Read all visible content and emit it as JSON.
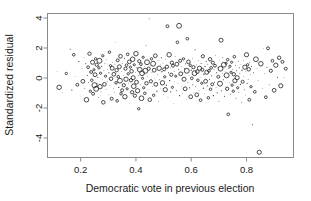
{
  "chart_data": {
    "type": "scatter",
    "title": "",
    "xlabel": "Democratic vote in previous election",
    "ylabel": "Standardized residual",
    "xlim": [
      0.08,
      0.97
    ],
    "ylim": [
      -5.3,
      4.3
    ],
    "xticks": [
      0.2,
      0.4,
      0.6,
      0.8
    ],
    "xticklabels": [
      "0.2",
      "0.4",
      "0.6",
      "0.8"
    ],
    "yticks": [
      -4,
      -2,
      0,
      2,
      4
    ],
    "yticklabels": [
      "-4",
      "-2",
      "0",
      "2",
      "4"
    ],
    "grid": false,
    "legend": null,
    "marker": "open-circle",
    "marker_color": "#2b2b2b",
    "points": [
      [
        0.115,
        0.45
      ],
      [
        0.122,
        -0.62
      ],
      [
        0.133,
        -0.95
      ],
      [
        0.148,
        0.3
      ],
      [
        0.162,
        1.92
      ],
      [
        0.168,
        -0.8
      ],
      [
        0.175,
        1.55
      ],
      [
        0.181,
        0.1
      ],
      [
        0.188,
        -0.45
      ],
      [
        0.193,
        1.1
      ],
      [
        0.198,
        -1.2
      ],
      [
        0.205,
        0.62
      ],
      [
        0.208,
        -0.22
      ],
      [
        0.212,
        1.38
      ],
      [
        0.215,
        -0.7
      ],
      [
        0.218,
        0.95
      ],
      [
        0.221,
        -1.45
      ],
      [
        0.224,
        0.18
      ],
      [
        0.227,
        0.72
      ],
      [
        0.229,
        -0.3
      ],
      [
        0.232,
        1.62
      ],
      [
        0.235,
        -0.88
      ],
      [
        0.238,
        0.4
      ],
      [
        0.24,
        -0.15
      ],
      [
        0.243,
        1.05
      ],
      [
        0.245,
        -1.05
      ],
      [
        0.248,
        0.55
      ],
      [
        0.25,
        -0.48
      ],
      [
        0.252,
        0.22
      ],
      [
        0.254,
        1.28
      ],
      [
        0.256,
        -0.72
      ],
      [
        0.258,
        0.88
      ],
      [
        0.26,
        -0.35
      ],
      [
        0.262,
        0.05
      ],
      [
        0.264,
        -1.3
      ],
      [
        0.266,
        0.68
      ],
      [
        0.268,
        1.15
      ],
      [
        0.27,
        -0.58
      ],
      [
        0.272,
        0.32
      ],
      [
        0.274,
        -0.92
      ],
      [
        0.276,
        0.78
      ],
      [
        0.278,
        -0.1
      ],
      [
        0.28,
        1.48
      ],
      [
        0.282,
        -1.62
      ],
      [
        0.284,
        0.48
      ],
      [
        0.286,
        -0.42
      ],
      [
        0.288,
        0.95
      ],
      [
        0.29,
        0.12
      ],
      [
        0.292,
        -0.78
      ],
      [
        0.294,
        1.22
      ],
      [
        0.296,
        -0.25
      ],
      [
        0.298,
        0.58
      ],
      [
        0.3,
        -1.12
      ],
      [
        0.302,
        0.35
      ],
      [
        0.304,
        1.72
      ],
      [
        0.306,
        -0.52
      ],
      [
        0.308,
        0.82
      ],
      [
        0.31,
        -0.05
      ],
      [
        0.312,
        -1.38
      ],
      [
        0.314,
        0.65
      ],
      [
        0.316,
        1.02
      ],
      [
        0.318,
        -0.68
      ],
      [
        0.32,
        0.25
      ],
      [
        0.322,
        -0.98
      ],
      [
        0.324,
        0.92
      ],
      [
        0.326,
        2.35
      ],
      [
        0.328,
        -0.32
      ],
      [
        0.33,
        0.52
      ],
      [
        0.332,
        -1.52
      ],
      [
        0.334,
        1.18
      ],
      [
        0.336,
        0.08
      ],
      [
        0.338,
        -0.62
      ],
      [
        0.34,
        0.75
      ],
      [
        0.342,
        -0.18
      ],
      [
        0.344,
        1.45
      ],
      [
        0.346,
        -1.05
      ],
      [
        0.348,
        0.42
      ],
      [
        0.35,
        -0.82
      ],
      [
        0.352,
        0.98
      ],
      [
        0.354,
        0.18
      ],
      [
        0.356,
        -0.48
      ],
      [
        0.358,
        1.32
      ],
      [
        0.36,
        -1.25
      ],
      [
        0.362,
        0.62
      ],
      [
        0.364,
        -0.08
      ],
      [
        0.366,
        0.85
      ],
      [
        0.368,
        -0.72
      ],
      [
        0.37,
        1.58
      ],
      [
        0.372,
        0.28
      ],
      [
        0.374,
        -0.38
      ],
      [
        0.376,
        1.08
      ],
      [
        0.378,
        -1.72
      ],
      [
        0.38,
        0.72
      ],
      [
        0.382,
        -0.15
      ],
      [
        0.384,
        0.45
      ],
      [
        0.386,
        -0.95
      ],
      [
        0.388,
        1.25
      ],
      [
        0.39,
        0.02
      ],
      [
        0.392,
        -0.55
      ],
      [
        0.394,
        0.88
      ],
      [
        0.396,
        -1.18
      ],
      [
        0.398,
        0.38
      ],
      [
        0.4,
        1.62
      ],
      [
        0.402,
        -0.28
      ],
      [
        0.404,
        0.68
      ],
      [
        0.406,
        -0.85
      ],
      [
        0.408,
        0.15
      ],
      [
        0.41,
        -2.05
      ],
      [
        0.412,
        1.12
      ],
      [
        0.414,
        0.55
      ],
      [
        0.416,
        -0.45
      ],
      [
        0.418,
        0.92
      ],
      [
        0.42,
        -1.35
      ],
      [
        0.422,
        0.32
      ],
      [
        0.424,
        -0.02
      ],
      [
        0.426,
        1.38
      ],
      [
        0.428,
        -0.65
      ],
      [
        0.43,
        0.78
      ],
      [
        0.432,
        -1.02
      ],
      [
        0.434,
        0.48
      ],
      [
        0.436,
        2.18
      ],
      [
        0.438,
        -0.35
      ],
      [
        0.44,
        1.05
      ],
      [
        0.442,
        0.12
      ],
      [
        0.444,
        -0.75
      ],
      [
        0.446,
        0.62
      ],
      [
        0.448,
        3.95
      ],
      [
        0.45,
        -1.45
      ],
      [
        0.452,
        0.85
      ],
      [
        0.454,
        -0.22
      ],
      [
        0.456,
        1.28
      ],
      [
        0.458,
        0.35
      ],
      [
        0.46,
        -0.58
      ],
      [
        0.462,
        0.95
      ],
      [
        0.464,
        -1.15
      ],
      [
        0.466,
        0.52
      ],
      [
        0.468,
        -0.05
      ],
      [
        0.47,
        1.48
      ],
      [
        0.472,
        -0.42
      ],
      [
        0.474,
        0.72
      ],
      [
        0.476,
        -0.88
      ],
      [
        0.478,
        0.25
      ],
      [
        0.48,
        1.18
      ],
      [
        0.482,
        -1.58
      ],
      [
        0.484,
        0.65
      ],
      [
        0.486,
        -0.12
      ],
      [
        0.488,
        0.88
      ],
      [
        0.49,
        -0.68
      ],
      [
        0.492,
        1.35
      ],
      [
        0.494,
        0.42
      ],
      [
        0.496,
        -0.32
      ],
      [
        0.498,
        0.98
      ],
      [
        0.5,
        -1.08
      ],
      [
        0.502,
        0.58
      ],
      [
        0.504,
        0.08
      ],
      [
        0.506,
        -0.78
      ],
      [
        0.508,
        1.22
      ],
      [
        0.51,
        -0.48
      ],
      [
        0.512,
        0.75
      ],
      [
        0.514,
        3.45
      ],
      [
        0.516,
        -1.28
      ],
      [
        0.518,
        0.35
      ],
      [
        0.52,
        1.55
      ],
      [
        0.522,
        -0.18
      ],
      [
        0.524,
        0.68
      ],
      [
        0.526,
        -0.92
      ],
      [
        0.528,
        0.22
      ],
      [
        0.53,
        1.02
      ],
      [
        0.532,
        -0.62
      ],
      [
        0.534,
        0.82
      ],
      [
        0.536,
        -1.72
      ],
      [
        0.538,
        0.45
      ],
      [
        0.54,
        -0.25
      ],
      [
        0.542,
        1.42
      ],
      [
        0.544,
        0.12
      ],
      [
        0.546,
        -0.85
      ],
      [
        0.548,
        0.92
      ],
      [
        0.55,
        2.38
      ],
      [
        0.552,
        -0.38
      ],
      [
        0.554,
        0.55
      ],
      [
        0.556,
        3.48
      ],
      [
        0.558,
        -1.18
      ],
      [
        0.56,
        1.15
      ],
      [
        0.562,
        0.28
      ],
      [
        0.564,
        -0.55
      ],
      [
        0.566,
        0.78
      ],
      [
        0.568,
        -1.02
      ],
      [
        0.57,
        0.38
      ],
      [
        0.572,
        1.28
      ],
      [
        0.574,
        -0.08
      ],
      [
        0.576,
        0.62
      ],
      [
        0.578,
        -0.72
      ],
      [
        0.58,
        0.95
      ],
      [
        0.582,
        -1.42
      ],
      [
        0.584,
        0.48
      ],
      [
        0.586,
        2.62
      ],
      [
        0.588,
        -0.28
      ],
      [
        0.59,
        1.08
      ],
      [
        0.592,
        0.18
      ],
      [
        0.594,
        -0.65
      ],
      [
        0.596,
        0.85
      ],
      [
        0.598,
        -1.25
      ],
      [
        0.6,
        0.52
      ],
      [
        0.602,
        -0.02
      ],
      [
        0.604,
        1.32
      ],
      [
        0.606,
        -0.45
      ],
      [
        0.608,
        0.72
      ],
      [
        0.61,
        -0.95
      ],
      [
        0.612,
        0.32
      ],
      [
        0.614,
        1.88
      ],
      [
        0.616,
        -0.58
      ],
      [
        0.618,
        0.88
      ],
      [
        0.62,
        -1.12
      ],
      [
        0.622,
        0.42
      ],
      [
        0.624,
        -0.15
      ],
      [
        0.626,
        1.18
      ],
      [
        0.628,
        -0.82
      ],
      [
        0.63,
        0.65
      ],
      [
        0.632,
        0.05
      ],
      [
        0.634,
        -1.48
      ],
      [
        0.636,
        0.98
      ],
      [
        0.638,
        -0.35
      ],
      [
        0.64,
        0.55
      ],
      [
        0.642,
        1.45
      ],
      [
        0.644,
        -0.68
      ],
      [
        0.646,
        0.25
      ],
      [
        0.648,
        -1.05
      ],
      [
        0.65,
        0.78
      ],
      [
        0.652,
        -0.22
      ],
      [
        0.654,
        1.12
      ],
      [
        0.656,
        0.38
      ],
      [
        0.658,
        -0.52
      ],
      [
        0.66,
        0.92
      ],
      [
        0.662,
        -1.32
      ],
      [
        0.664,
        0.48
      ],
      [
        0.666,
        -0.08
      ],
      [
        0.668,
        1.25
      ],
      [
        0.67,
        -0.75
      ],
      [
        0.672,
        0.68
      ],
      [
        0.674,
        0.15
      ],
      [
        0.676,
        -0.42
      ],
      [
        0.678,
        1.02
      ],
      [
        0.68,
        -1.18
      ],
      [
        0.682,
        0.58
      ],
      [
        0.684,
        -0.28
      ],
      [
        0.686,
        0.82
      ],
      [
        0.688,
        1.52
      ],
      [
        0.69,
        -0.62
      ],
      [
        0.692,
        0.35
      ],
      [
        0.694,
        -0.98
      ],
      [
        0.696,
        0.72
      ],
      [
        0.698,
        0.08
      ],
      [
        0.7,
        -1.55
      ],
      [
        0.702,
        1.15
      ],
      [
        0.704,
        -0.38
      ],
      [
        0.706,
        0.62
      ],
      [
        0.708,
        2.52
      ],
      [
        0.71,
        -0.85
      ],
      [
        0.712,
        0.28
      ],
      [
        0.714,
        1.35
      ],
      [
        0.716,
        -0.12
      ],
      [
        0.718,
        0.88
      ],
      [
        0.72,
        -1.22
      ],
      [
        0.722,
        0.45
      ],
      [
        0.724,
        -0.55
      ],
      [
        0.726,
        0.98
      ],
      [
        0.728,
        0.18
      ],
      [
        0.73,
        -0.72
      ],
      [
        0.732,
        1.22
      ],
      [
        0.734,
        -2.42
      ],
      [
        0.736,
        0.65
      ],
      [
        0.738,
        -0.32
      ],
      [
        0.74,
        0.78
      ],
      [
        0.742,
        -1.08
      ],
      [
        0.744,
        0.38
      ],
      [
        0.746,
        1.05
      ],
      [
        0.748,
        -0.48
      ],
      [
        0.75,
        0.55
      ],
      [
        0.752,
        -0.88
      ],
      [
        0.754,
        0.25
      ],
      [
        0.756,
        1.42
      ],
      [
        0.758,
        -0.18
      ],
      [
        0.76,
        0.85
      ],
      [
        0.762,
        -1.35
      ],
      [
        0.764,
        0.48
      ],
      [
        0.766,
        0.02
      ],
      [
        0.768,
        -0.65
      ],
      [
        0.77,
        1.12
      ],
      [
        0.772,
        -0.95
      ],
      [
        0.774,
        0.68
      ],
      [
        0.776,
        0.32
      ],
      [
        0.778,
        -0.42
      ],
      [
        0.78,
        0.92
      ],
      [
        0.782,
        -1.62
      ],
      [
        0.784,
        0.52
      ],
      [
        0.786,
        -0.25
      ],
      [
        0.788,
        1.18
      ],
      [
        0.79,
        0.12
      ],
      [
        0.792,
        -0.78
      ],
      [
        0.794,
        0.72
      ],
      [
        0.796,
        -1.15
      ],
      [
        0.798,
        0.42
      ],
      [
        0.8,
        1.55
      ],
      [
        0.802,
        -0.35
      ],
      [
        0.804,
        0.88
      ],
      [
        0.806,
        -0.08
      ],
      [
        0.808,
        0.58
      ],
      [
        0.81,
        -1.45
      ],
      [
        0.812,
        1.02
      ],
      [
        0.814,
        0.22
      ],
      [
        0.816,
        -0.58
      ],
      [
        0.818,
        0.78
      ],
      [
        0.822,
        -3.12
      ],
      [
        0.826,
        0.35
      ],
      [
        0.83,
        -0.92
      ],
      [
        0.834,
        1.25
      ],
      [
        0.838,
        0.62
      ],
      [
        0.842,
        -0.18
      ],
      [
        0.846,
        -4.95
      ],
      [
        0.852,
        0.95
      ],
      [
        0.858,
        -0.68
      ],
      [
        0.862,
        1.95
      ],
      [
        0.866,
        0.28
      ],
      [
        0.87,
        -1.28
      ],
      [
        0.874,
        0.72
      ],
      [
        0.878,
        1.98
      ],
      [
        0.882,
        -0.45
      ],
      [
        0.888,
        0.48
      ],
      [
        0.894,
        1.15
      ],
      [
        0.9,
        -0.82
      ],
      [
        0.906,
        0.85
      ],
      [
        0.912,
        0.05
      ],
      [
        0.918,
        1.35
      ],
      [
        0.924,
        -0.52
      ],
      [
        0.93,
        1.08
      ],
      [
        0.936,
        0.02
      ],
      [
        0.942,
        0.62
      ]
    ]
  },
  "figure": {
    "background_color": "#ffffff",
    "frame_color": "#8a8a8a",
    "point_color": "#2b2b2b"
  }
}
